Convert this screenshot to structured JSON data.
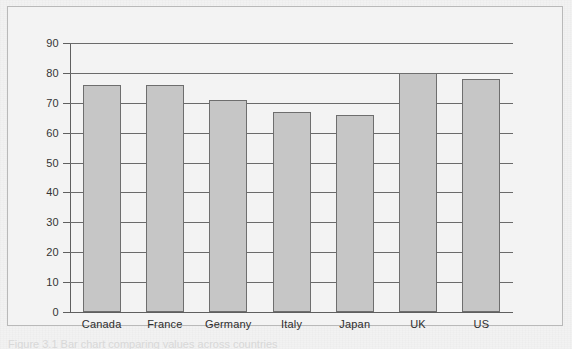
{
  "figure": {
    "caption": "Figure 3.1  Bar chart comparing values across countries",
    "panel_background": "#f3f3f3",
    "panel_border_color": "#b9b9b9",
    "page_background": "#f2f2f2"
  },
  "chart_data": {
    "type": "bar",
    "title": "",
    "xlabel": "",
    "ylabel": "",
    "categories": [
      "Canada",
      "France",
      "Germany",
      "Italy",
      "Japan",
      "UK",
      "US"
    ],
    "values": [
      76,
      76,
      71,
      67,
      66,
      80,
      78
    ],
    "ylim": [
      0,
      90
    ],
    "ytick_labels": [
      "0",
      "10",
      "20",
      "30",
      "40",
      "50",
      "60",
      "70",
      "80",
      "90"
    ],
    "ytick_values": [
      0,
      10,
      20,
      30,
      40,
      50,
      60,
      70,
      80,
      90
    ],
    "grid": true,
    "legend": false,
    "bar_fill_color": "#c6c6c6",
    "bar_edge_color": "#6e6e6e",
    "axis_color": "#5f5f5f",
    "grid_color": "#6a6a6a"
  }
}
